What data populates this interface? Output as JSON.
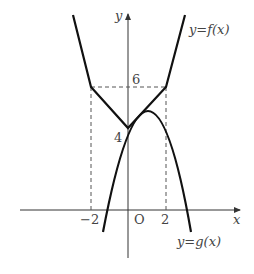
{
  "figure": {
    "axis_labels": {
      "x": "x",
      "y": "y",
      "origin": "O"
    },
    "tick_labels": {
      "x_neg2": "−2",
      "x_pos2": "2",
      "y_6": "6",
      "y_4": "4"
    },
    "curve_labels": {
      "f": "y=f(x)",
      "g": "y=g(x)"
    },
    "colors": {
      "curve": "#111111",
      "axis": "#333333",
      "dashed": "#555555",
      "text": "#444444"
    }
  }
}
